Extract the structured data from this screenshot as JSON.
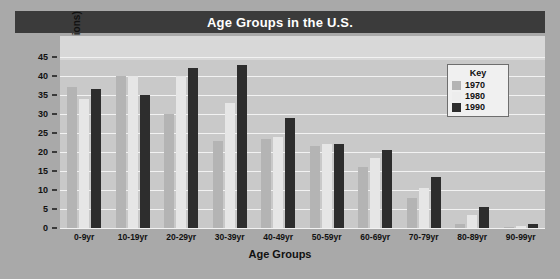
{
  "chart_data": {
    "type": "bar",
    "title": "Age Groups in the U.S.",
    "xlabel": "Age Groups",
    "ylabel": "Number of People (in millions)",
    "categories": [
      "0-9yr",
      "10-19yr",
      "20-29yr",
      "30-39yr",
      "40-49yr",
      "50-59yr",
      "60-69yr",
      "70-79yr",
      "80-89yr",
      "90-99yr"
    ],
    "series": [
      {
        "name": "1970",
        "color": "#b4b4b4",
        "values": [
          37,
          40,
          30,
          23,
          23.5,
          21.5,
          16,
          8,
          1,
          0.3
        ]
      },
      {
        "name": "1980",
        "color": "#e6e6e6",
        "values": [
          34,
          40,
          40,
          33,
          24,
          22,
          18.5,
          10.5,
          3.5,
          0.6
        ]
      },
      {
        "name": "1990",
        "color": "#2d2d2d",
        "values": [
          36.5,
          35,
          42,
          43,
          29,
          22,
          20.5,
          13.5,
          5.5,
          1
        ]
      }
    ],
    "ylim": [
      0,
      45
    ],
    "yticks": [
      0,
      5,
      10,
      15,
      20,
      25,
      30,
      35,
      40,
      45
    ],
    "grid": true,
    "legend": {
      "title": "Key",
      "position": "top-right",
      "entries": [
        "1970",
        "1980",
        "1990"
      ]
    }
  }
}
